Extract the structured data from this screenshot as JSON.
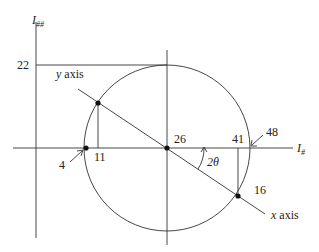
{
  "diagram": {
    "type": "mohrs-circle",
    "axes": {
      "vertical_label": "I",
      "vertical_subscript": "##",
      "horizontal_label": "I",
      "horizontal_subscript": "#"
    },
    "tick_labels": {
      "top": "22",
      "left_point": "4",
      "upper_point_x": "11",
      "center": "26",
      "lower_point_x": "41",
      "right_point": "48",
      "lower_point": "16"
    },
    "annotations": {
      "y_axis": "y axis",
      "x_axis": "x axis",
      "angle": "2θ"
    },
    "colors": {
      "stroke": "#333333",
      "text": "#222222"
    }
  }
}
